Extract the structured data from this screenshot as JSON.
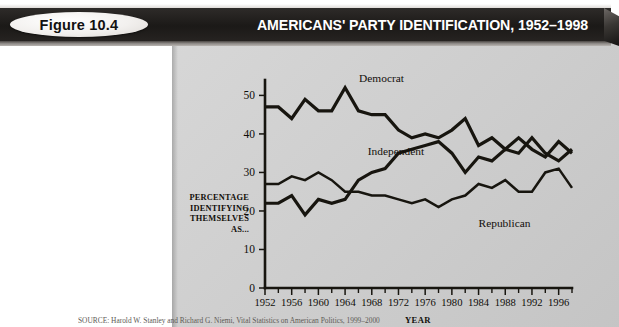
{
  "header": {
    "figure_badge": "Figure 10.4",
    "title": "AMERICANS' PARTY IDENTIFICATION, 1952–1998",
    "bar_color": "#221f1e",
    "badge_color": "#f2f0ee",
    "title_color": "#ffffff"
  },
  "panel": {
    "background_color": "#cfcfcf"
  },
  "source": {
    "text": "SOURCE: Harold W. Stanley and Richard G. Niemi, Vital Statistics on American Politics, 1999–2000"
  },
  "chart_data": {
    "type": "line",
    "title": "AMERICANS' PARTY IDENTIFICATION, 1952–1998",
    "xlabel": "YEAR",
    "ylabel": "PERCENTAGE IDENTIFYING THEMSELVES AS...",
    "ylabel_lines": [
      "PERCENTAGE",
      "IDENTIFYING",
      "THEMSELVES",
      "AS..."
    ],
    "xlim": [
      1952,
      1998
    ],
    "ylim": [
      0,
      54
    ],
    "grid": false,
    "legend": "inline-annotations",
    "ytick_labels": [
      "0",
      "10",
      "20",
      "30",
      "40",
      "50"
    ],
    "ytick_values": [
      0,
      10,
      20,
      30,
      40,
      50
    ],
    "xtick_labels": [
      "1952",
      "1956",
      "1960",
      "1964",
      "1968",
      "1972",
      "1976",
      "1980",
      "1984",
      "1988",
      "1992",
      "1996"
    ],
    "xtick_values": [
      1952,
      1956,
      1960,
      1964,
      1968,
      1972,
      1976,
      1980,
      1984,
      1988,
      1992,
      1996
    ],
    "xtick_minor_values": [
      1954,
      1958,
      1962,
      1966,
      1970,
      1974,
      1978,
      1982,
      1986,
      1990,
      1994,
      1998
    ],
    "x": [
      1952,
      1954,
      1956,
      1958,
      1960,
      1962,
      1964,
      1966,
      1968,
      1970,
      1972,
      1974,
      1976,
      1978,
      1980,
      1982,
      1984,
      1986,
      1988,
      1990,
      1992,
      1994,
      1996,
      1998
    ],
    "series": [
      {
        "name": "Democrat",
        "label": "Democrat",
        "color": "#17150f",
        "values": [
          47,
          47,
          44,
          49,
          46,
          46,
          52,
          46,
          45,
          45,
          41,
          39,
          40,
          39,
          41,
          44,
          37,
          39,
          36,
          39,
          36,
          34,
          38,
          35
        ]
      },
      {
        "name": "Independent",
        "label": "Independent",
        "color": "#17150f",
        "values": [
          22,
          22,
          24,
          19,
          23,
          22,
          23,
          28,
          30,
          31,
          35,
          36,
          37,
          38,
          35,
          30,
          34,
          33,
          36,
          35,
          39,
          35,
          33,
          36
        ]
      },
      {
        "name": "Republican",
        "label": "Republican",
        "color": "#17150f",
        "values": [
          27,
          27,
          29,
          28,
          30,
          28,
          25,
          25,
          24,
          24,
          23,
          22,
          23,
          21,
          23,
          24,
          27,
          26,
          28,
          25,
          25,
          30,
          31,
          26
        ]
      }
    ],
    "annotations": [
      {
        "text": "Democrat",
        "x": 1964,
        "y": 52
      },
      {
        "text": "Independent",
        "x": 1968,
        "y": 36
      },
      {
        "text": "Republican",
        "x": 1984,
        "y": 20
      }
    ]
  }
}
